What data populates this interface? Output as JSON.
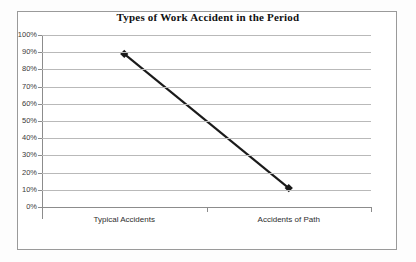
{
  "chart_data": {
    "type": "line",
    "title": "Types of Work Accident in the Period",
    "xlabel": "",
    "ylabel": "",
    "categories": [
      "Typical Accidents",
      "Accidents of Path"
    ],
    "values": [
      89,
      11
    ],
    "series": [
      {
        "name": "Types of Work Accident in the Period",
        "values": [
          89,
          11
        ],
        "color": "#1a1a1a",
        "marker": "diamond"
      }
    ],
    "ylim": [
      0,
      100
    ],
    "ytick_labels": [
      "100%",
      "90%",
      "80%",
      "70%",
      "60%",
      "50%",
      "40%",
      "30%",
      "20%",
      "10%",
      "0%"
    ],
    "ytick_values": [
      100,
      90,
      80,
      70,
      60,
      50,
      40,
      30,
      20,
      10,
      0
    ],
    "grid": true,
    "grid_axis": "y",
    "legend": false,
    "legend_position": "none",
    "value_format": "percent",
    "plot_background": "#ffffff",
    "grid_color": "#b9b9b9",
    "axis_color": "#8c8c8c",
    "border_color": "#9a9a9a",
    "title_color": "#111111"
  }
}
